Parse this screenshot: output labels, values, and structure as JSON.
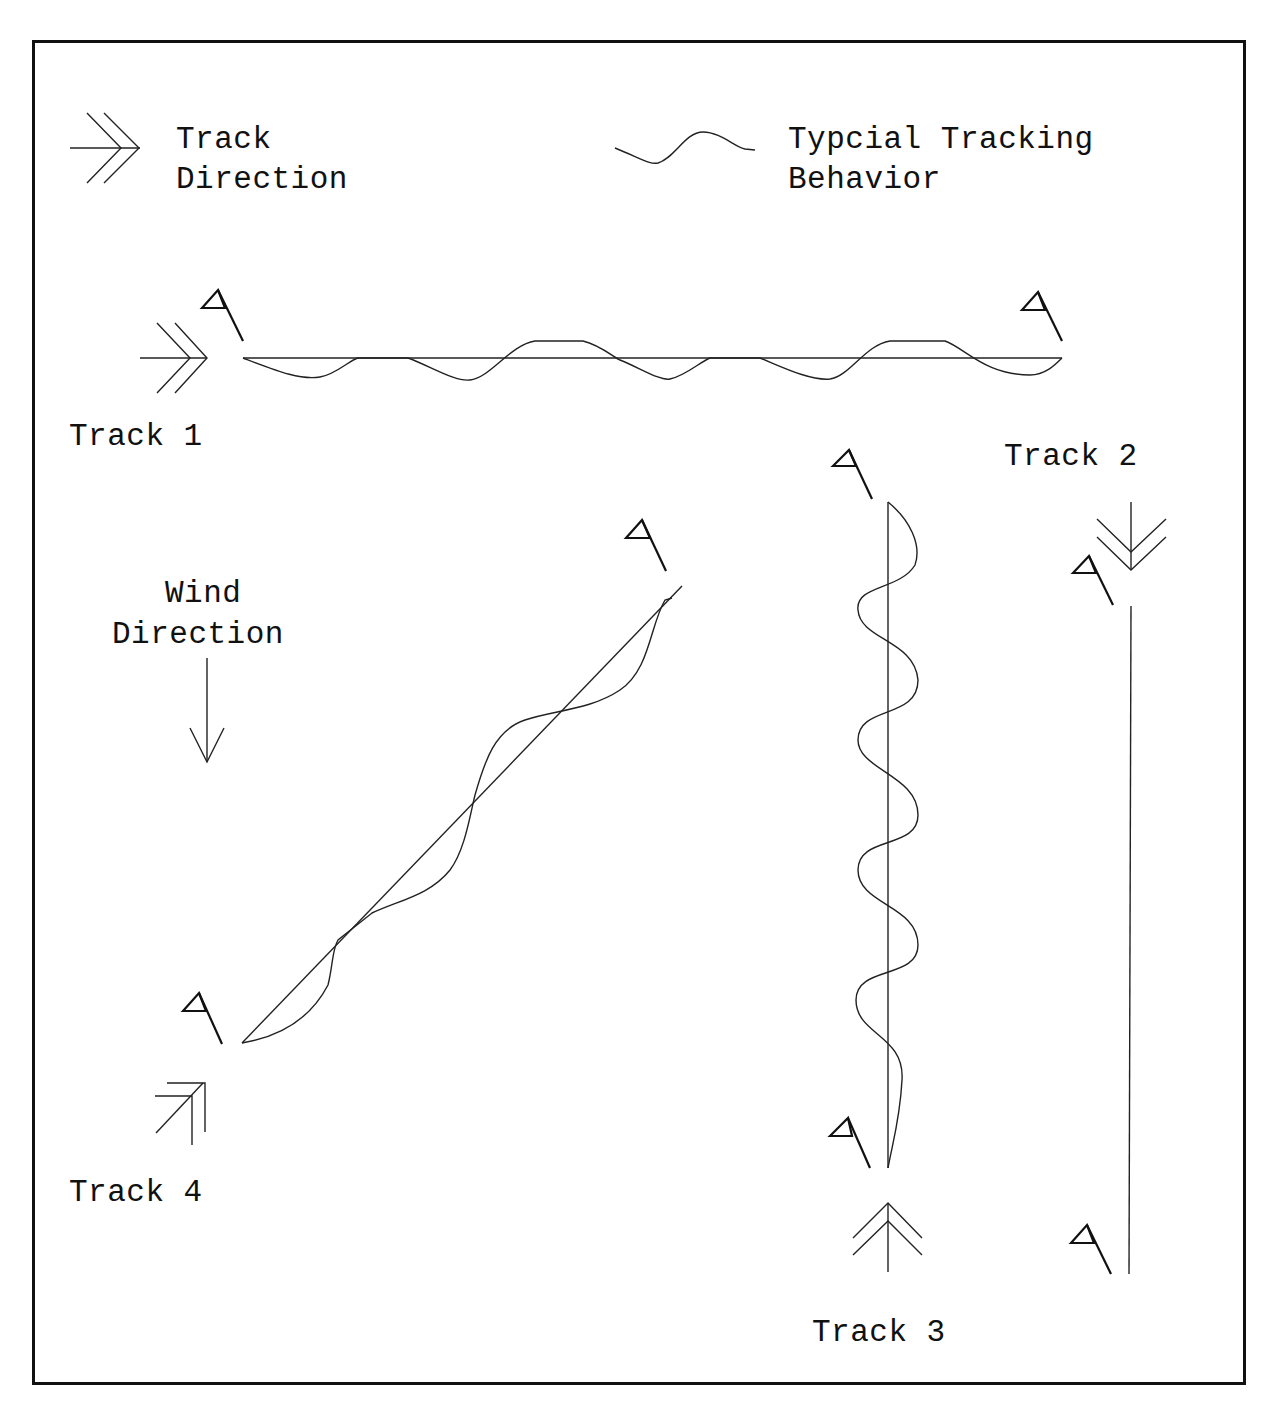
{
  "legend": {
    "track_direction": {
      "icon": "double-chevron-arrow-icon",
      "line1": "Track",
      "line2": "Direction"
    },
    "tracking_behavior": {
      "icon": "wavy-line-icon",
      "line1": "Typcial Tracking",
      "line2": "Behavior"
    }
  },
  "wind": {
    "line1": "Wind",
    "line2": "Direction",
    "icon": "down-arrow-icon"
  },
  "tracks": [
    {
      "id": 1,
      "label": "Track 1",
      "orientation": "horizontal",
      "direction": "left-to-right",
      "behavior": "weaving"
    },
    {
      "id": 2,
      "label": "Track 2",
      "orientation": "vertical",
      "direction": "top-to-bottom",
      "behavior": "straight"
    },
    {
      "id": 3,
      "label": "Track 3",
      "orientation": "vertical",
      "direction": "bottom-to-top",
      "behavior": "weaving"
    },
    {
      "id": 4,
      "label": "Track 4",
      "orientation": "diagonal",
      "direction": "bottom-left-to-top-right",
      "behavior": "weaving"
    }
  ],
  "marker_icon": "flag-icon"
}
